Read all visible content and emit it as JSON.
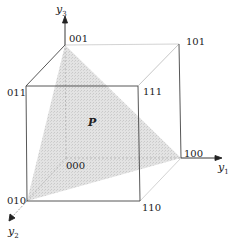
{
  "diagram": {
    "type": "3d-unit-cube",
    "colors": {
      "edge": "#444444",
      "hidden_edge": "#b8b8b8",
      "shaded_region": "#d9d9d9",
      "text": "#222222"
    },
    "axes": {
      "y1": {
        "name": "y",
        "sub": "1"
      },
      "y2": {
        "name": "y",
        "sub": "2"
      },
      "y3": {
        "name": "y",
        "sub": "3"
      }
    },
    "vertices": {
      "v000": "000",
      "v001": "001",
      "v010": "010",
      "v011": "011",
      "v100": "100",
      "v101": "101",
      "v110": "110",
      "v111": "111"
    },
    "region": {
      "label": "P",
      "vertices": [
        "001",
        "100",
        "010"
      ]
    }
  }
}
